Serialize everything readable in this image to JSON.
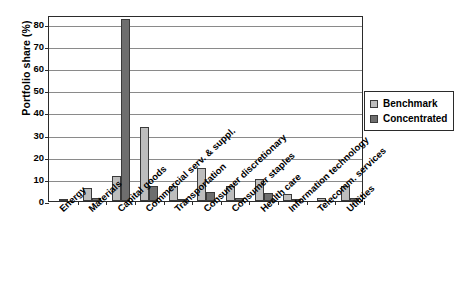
{
  "chart_data": {
    "type": "bar",
    "title": "",
    "xlabel": "",
    "ylabel": "Portfolio share (%)",
    "ylim": [
      0,
      84
    ],
    "yticks": [
      0,
      10,
      20,
      30,
      40,
      50,
      60,
      70,
      80
    ],
    "grid": true,
    "legend_position": "top-right-outside",
    "categories": [
      "Energy",
      "Materials",
      "Capital goods",
      "Commercial serv. & suppl.",
      "Transportation",
      "Consumer discretionary",
      "Consumer staples",
      "Health care",
      "Information technology",
      "Telecomm. services",
      "Utilities"
    ],
    "series": [
      {
        "name": "Benchmark",
        "color": "#bdbdbd",
        "values": [
          0.3,
          6.0,
          11.5,
          33.5,
          7.0,
          15.0,
          7.0,
          10.0,
          3.0,
          1.5,
          7.0
        ]
      },
      {
        "name": "Concentrated",
        "color": "#6e6e6e",
        "values": [
          0.0,
          1.3,
          82.0,
          6.8,
          1.0,
          4.0,
          1.5,
          3.5,
          0.3,
          0.0,
          1.2
        ]
      }
    ]
  },
  "legend": {
    "entries": [
      {
        "label": "Benchmark"
      },
      {
        "label": "Concentrated"
      }
    ]
  },
  "axis": {
    "y_title": "Portfolio share (%)",
    "tick_labels": [
      "0",
      "10",
      "20",
      "30",
      "40",
      "50",
      "60",
      "70",
      "80"
    ]
  }
}
